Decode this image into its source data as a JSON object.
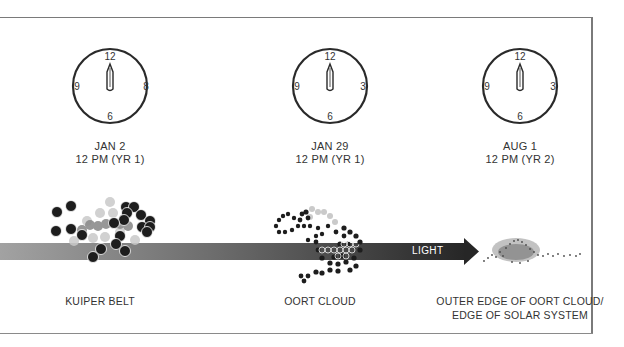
{
  "clocks": [
    {
      "numerals": {
        "top": "12",
        "left": "9",
        "right": "8",
        "bottom": "6"
      },
      "date": "JAN 2",
      "time": "12 PM (YR 1)"
    },
    {
      "numerals": {
        "top": "12",
        "left": "9",
        "right": "3",
        "bottom": "6"
      },
      "date": "JAN 29",
      "time": "12 PM (YR 1)"
    },
    {
      "numerals": {
        "top": "12",
        "left": "9",
        "right": "3",
        "bottom": "6"
      },
      "date": "AUG 1",
      "time": "12 PM (YR 2)"
    }
  ],
  "arrow": {
    "label": "LIGHT",
    "gradient_start": "#9a9a9a",
    "gradient_end": "#2b2b2b"
  },
  "regions": {
    "kuiper": "KUIPER BELT",
    "oort": "OORT CLOUD",
    "edge_line1": "OUTER EDGE OF OORT CLOUD/",
    "edge_line2": "EDGE OF SOLAR SYSTEM"
  }
}
